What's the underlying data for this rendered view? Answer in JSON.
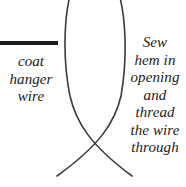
{
  "diagram": {
    "type": "sewing-instruction-diagram",
    "background_color": "#ffffff",
    "line_color": "#333333",
    "bar_color": "#1a1a1a",
    "wire_bar": {
      "label": "coat hanger wire"
    },
    "instruction": {
      "label": "Sew\nhem in\nopening\nand\nthread\nthe wire\nthrough",
      "lines": [
        "Sew",
        "hem in",
        "opening",
        "and",
        "thread",
        "the wire",
        "through"
      ]
    },
    "shape": {
      "name": "fish-tail-fabric-outline",
      "description": "two crossing curves forming a leaf body with a tail"
    }
  }
}
